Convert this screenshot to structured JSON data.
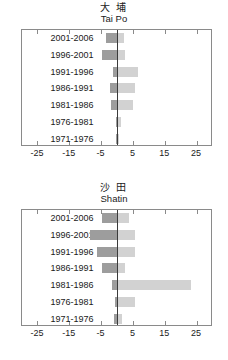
{
  "panels": [
    {
      "title_cn": "大 埔",
      "title_en": "Tai Po",
      "name": "tai-po"
    },
    {
      "title_cn": "沙 田",
      "title_en": "Shatin",
      "name": "shatin"
    }
  ],
  "axis": {
    "ticks": [
      -25,
      -15,
      -5,
      5,
      15,
      25
    ],
    "tick_labels": [
      "-25",
      "-15",
      "-5",
      "5",
      "15",
      "25"
    ],
    "min": -30,
    "max": 30
  },
  "colors": {
    "negative": "#9d9d9d",
    "positive": "#d2d2d2",
    "frame": "#8a8a8a",
    "zero_line": "#3b3b3b",
    "text": "#1a1a1a",
    "background": "#ffffff"
  },
  "chart_data": [
    {
      "type": "bar",
      "title": "大 埔 / Tai Po",
      "orientation": "horizontal",
      "xlabel": "",
      "ylabel": "",
      "xlim": [
        -30,
        30
      ],
      "grid": false,
      "legend": null,
      "categories": [
        "2001-2006",
        "1996-2001",
        "1991-1996",
        "1986-1991",
        "1981-1986",
        "1976-1981",
        "1971-1976"
      ],
      "series": [
        {
          "name": "negative",
          "values": [
            -3.5,
            -5.0,
            -1.5,
            -2.5,
            -2.0,
            -0.6,
            -0.6
          ]
        },
        {
          "name": "positive",
          "values": [
            2.0,
            2.5,
            6.5,
            5.5,
            5.0,
            1.2,
            0.6
          ]
        }
      ]
    },
    {
      "type": "bar",
      "title": "沙 田 / Shatin",
      "orientation": "horizontal",
      "xlabel": "",
      "ylabel": "",
      "xlim": [
        -30,
        30
      ],
      "grid": false,
      "legend": null,
      "categories": [
        "2001-2006",
        "1996-2001",
        "1991-1996",
        "1986-1991",
        "1981-1986",
        "1976-1981",
        "1971-1976"
      ],
      "series": [
        {
          "name": "negative",
          "values": [
            -5.0,
            -8.5,
            -6.5,
            -5.0,
            -1.8,
            -0.8,
            -1.0
          ]
        },
        {
          "name": "positive",
          "values": [
            3.5,
            5.5,
            5.5,
            2.5,
            23.0,
            5.5,
            1.5
          ]
        }
      ]
    }
  ]
}
